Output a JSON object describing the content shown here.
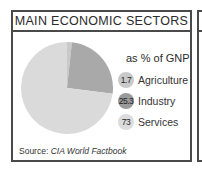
{
  "panel": {
    "title": "MAIN ECONOMIC SECTORS",
    "subtitle": "as % of GNP",
    "source_prefix": "Source: ",
    "source_name": "CIA World Factbook"
  },
  "legend": [
    {
      "value": "1.7",
      "label": "Agriculture",
      "color": "#c9c9c9"
    },
    {
      "value": "25.3",
      "label": "Industry",
      "color": "#9a9a9a"
    },
    {
      "value": "73",
      "label": "Services",
      "color": "#dcdcdc"
    }
  ],
  "chart_data": {
    "type": "pie",
    "title": "MAIN ECONOMIC SECTORS",
    "subtitle": "as % of GNP",
    "categories": [
      "Agriculture",
      "Industry",
      "Services"
    ],
    "values": [
      1.7,
      25.3,
      73
    ],
    "colors": [
      "#c9c9c9",
      "#a9a9a9",
      "#dadada"
    ],
    "start_angle": "12 o'clock, clockwise",
    "legend_position": "right",
    "source": "Source: CIA World Factbook"
  }
}
